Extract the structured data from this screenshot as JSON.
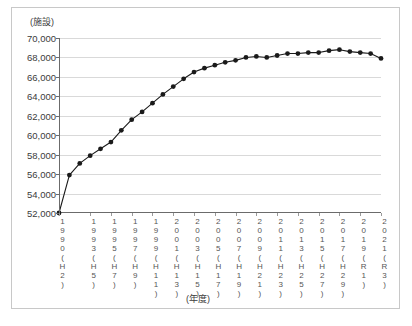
{
  "chart_data": {
    "type": "line",
    "title": "",
    "xlabel": "(年度)",
    "ylabel": "(施設)",
    "ylim": [
      52000,
      70000
    ],
    "ytick_values": [
      52000,
      54000,
      56000,
      58000,
      60000,
      62000,
      64000,
      66000,
      68000,
      70000
    ],
    "ytick_labels": [
      "52,000",
      "54,000",
      "56,000",
      "58,000",
      "60,000",
      "62,000",
      "64,000",
      "66,000",
      "68,000",
      "70,000"
    ],
    "grid": true,
    "legend": "none",
    "marker": "filled-circle",
    "line_color": "#1a1a1a",
    "marker_color": "#1a1a1a",
    "grid_color": "#d9d9d9",
    "x": [
      1990,
      1991,
      1992,
      1993,
      1994,
      1995,
      1996,
      1997,
      1998,
      1999,
      2000,
      2001,
      2002,
      2003,
      2004,
      2005,
      2006,
      2007,
      2008,
      2009,
      2010,
      2011,
      2012,
      2013,
      2014,
      2015,
      2016,
      2017,
      2018,
      2019,
      2020,
      2021
    ],
    "values": [
      52000,
      55900,
      57100,
      57900,
      58600,
      59300,
      60500,
      61600,
      62400,
      63300,
      64200,
      65000,
      65800,
      66500,
      66900,
      67200,
      67500,
      67700,
      68000,
      68100,
      68000,
      68200,
      68400,
      68400,
      68500,
      68500,
      68700,
      68800,
      68600,
      68500,
      68400,
      67900
    ],
    "xtick_labels": [
      {
        "year": "1990",
        "era": "(H2)",
        "vertical": "1990\n(H2)"
      },
      {
        "year": "1993",
        "era": "(H5)",
        "vertical": "1993\n(H5)"
      },
      {
        "year": "1995",
        "era": "(H7)",
        "vertical": "1995\n(H7)"
      },
      {
        "year": "1997",
        "era": "(H9)",
        "vertical": "1997\n(H9)"
      },
      {
        "year": "1999",
        "era": "(H11)",
        "vertical": "1999\n(H11)"
      },
      {
        "year": "2001",
        "era": "(H13)",
        "vertical": "2001\n(H13)"
      },
      {
        "year": "2003",
        "era": "(H15)",
        "vertical": "2003\n(H15)"
      },
      {
        "year": "2005",
        "era": "(H17)",
        "vertical": "2005\n(H17)"
      },
      {
        "year": "2007",
        "era": "(H19)",
        "vertical": "2007\n(H19)"
      },
      {
        "year": "2009",
        "era": "(H21)",
        "vertical": "2009\n(H21)"
      },
      {
        "year": "2011",
        "era": "(H23)",
        "vertical": "2011\n(H23)"
      },
      {
        "year": "2013",
        "era": "(H25)",
        "vertical": "2013\n(H25)"
      },
      {
        "year": "2015",
        "era": "(H27)",
        "vertical": "2015\n(H27)"
      },
      {
        "year": "2017",
        "era": "(H29)",
        "vertical": "2017\n(H29)"
      },
      {
        "year": "2019",
        "era": "(R1)",
        "vertical": "2019\n(R1)"
      },
      {
        "year": "2021",
        "era": "(R3)",
        "vertical": "2021\n(R3)"
      }
    ]
  }
}
